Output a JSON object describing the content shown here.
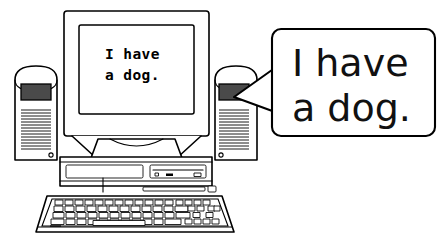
{
  "illustration": {
    "title": "Desktop computer with speech bubble",
    "background_color": "#ffffff",
    "line_color": "#000000",
    "panel_color": "#4a4a4a"
  },
  "monitor": {
    "screen_line_1": "I have",
    "screen_line_2": "a dog.",
    "screen_text_color": "#000000",
    "screen_background": "#ffffff"
  },
  "speech_bubble": {
    "line_1": "I have",
    "line_2": "a dog.",
    "text_color": "#111111",
    "background": "#ffffff",
    "border_color": "#000000",
    "tail_target": "right-speaker"
  },
  "speakers": {
    "left_label": "left-speaker",
    "right_label": "right-speaker",
    "panel_color": "#4a4a4a",
    "grille_line_count": 16
  },
  "tower": {
    "label": "desktop-case",
    "floppy_drive_label": "floppy-drive-bay",
    "optical_drive_label": "optical-drive-bay"
  },
  "keyboard": {
    "label": "keyboard"
  }
}
